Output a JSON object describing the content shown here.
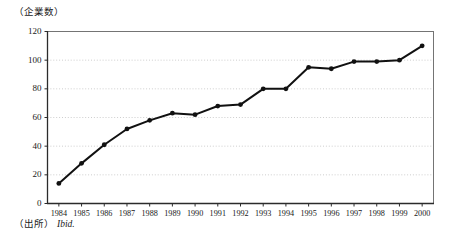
{
  "figure": {
    "y_axis_unit": "（企業数）",
    "source_label": "（出所）",
    "source_value": "Ibid."
  },
  "chart_data": {
    "type": "line",
    "title": "",
    "subtitle": "",
    "xlabel": "",
    "ylabel": "（企業数）",
    "categories": [
      "1984",
      "1985",
      "1986",
      "1987",
      "1988",
      "1989",
      "1990",
      "1991",
      "1992",
      "1993",
      "1994",
      "1995",
      "1996",
      "1997",
      "1998",
      "1999",
      "2000"
    ],
    "values": [
      14,
      28,
      41,
      52,
      58,
      63,
      62,
      68,
      69,
      80,
      80,
      95,
      94,
      99,
      99,
      100,
      110
    ],
    "series": [
      {
        "name": "企業数",
        "values": [
          14,
          28,
          41,
          52,
          58,
          63,
          62,
          68,
          69,
          80,
          80,
          95,
          94,
          99,
          99,
          100,
          110
        ]
      }
    ],
    "ylim": [
      0,
      120
    ],
    "yticks": [
      0,
      20,
      40,
      60,
      80,
      100,
      120
    ],
    "ytick_labels": [
      "0",
      "20",
      "40",
      "60",
      "80",
      "100",
      "120"
    ],
    "xtick_labels": [
      "1984",
      "1985",
      "1986",
      "1987",
      "1988",
      "1989",
      "1990",
      "1991",
      "1992",
      "1993",
      "1994",
      "1995",
      "1996",
      "1997",
      "1998",
      "1999",
      "2000"
    ],
    "grid": true,
    "grid_axis": "y",
    "legend": false,
    "legend_position": "none",
    "marker": "circle",
    "line_color": "#111111",
    "marker_color": "#111111",
    "grid_color": "#b9b9b9",
    "axis_color": "#2b2b2b",
    "background_color": "#ffffff",
    "annotations": []
  }
}
